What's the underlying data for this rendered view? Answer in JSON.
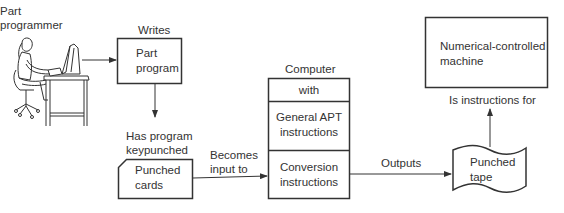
{
  "diagram": {
    "nodes": {
      "part_programmer": {
        "label_line1": "Part",
        "label_line2": "programmer",
        "icon": "person-at-computer-icon"
      },
      "part_program": {
        "line1": "Part",
        "line2": "program"
      },
      "punched_cards": {
        "line1": "Punched",
        "line2": "cards"
      },
      "computer": {
        "title": "Computer",
        "rows": [
          {
            "line1": "with",
            "line2": ""
          },
          {
            "line1": "General APT",
            "line2": "instructions"
          },
          {
            "line1": "Conversion",
            "line2": "instructions"
          }
        ]
      },
      "punched_tape": {
        "line1": "Punched",
        "line2": "tape"
      },
      "nc_machine": {
        "line1": "Numerical-controlled",
        "line2": "machine"
      }
    },
    "edges": {
      "writes": {
        "label": "Writes"
      },
      "keypunched": {
        "line1": "Has program",
        "line2": "keypunched"
      },
      "becomes_input": {
        "line1": "Becomes",
        "line2": "input to"
      },
      "outputs": {
        "label": "Outputs"
      },
      "instructions_for": {
        "label": "Is instructions for"
      }
    },
    "colors": {
      "stroke": "#333333",
      "text": "#333333",
      "background": "#ffffff"
    }
  }
}
